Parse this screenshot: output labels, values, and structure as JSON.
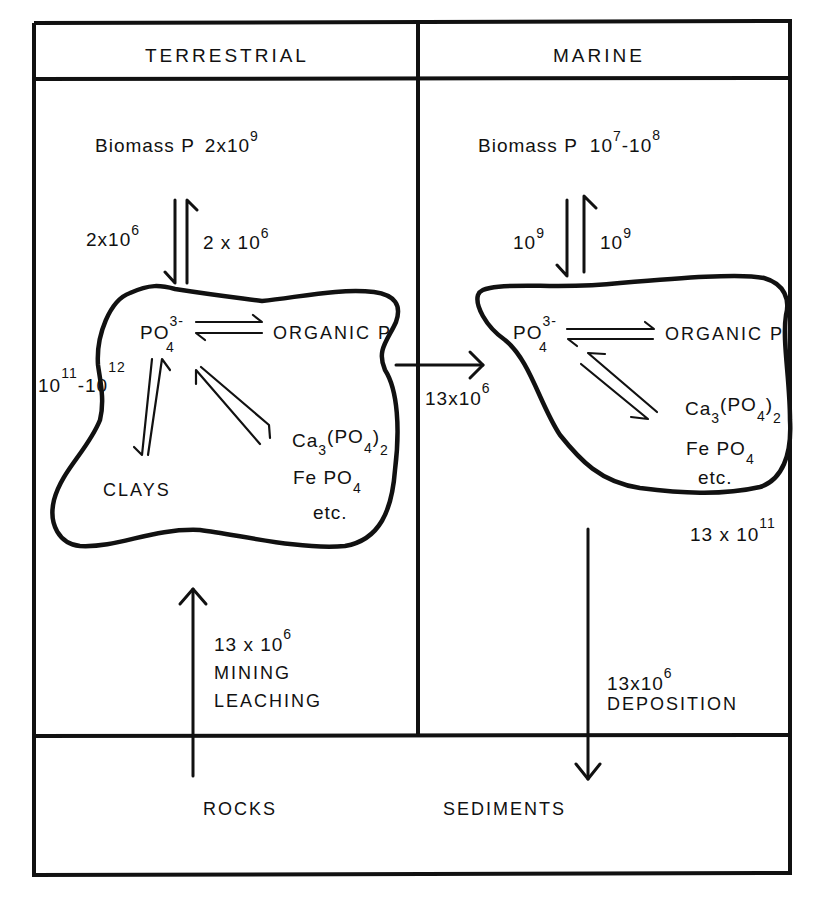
{
  "headers": {
    "terrestrial": "TERRESTRIAL",
    "marine": "MARINE"
  },
  "terrestrial": {
    "biomass": {
      "label": "Biomass  P",
      "base": "2x10",
      "exponent": "9"
    },
    "flux_down": {
      "base": "2x10",
      "exponent": "6"
    },
    "flux_up": {
      "base": "2 x 10",
      "exponent": "6"
    },
    "pool": {
      "phosphate": {
        "base": "PO",
        "subscript": "4",
        "superscript": "3-"
      },
      "organic_p": "ORGANIC P",
      "clays": "CLAYS",
      "minerals": {
        "calcium_phosphate": {
          "a": "Ca",
          "a_sub": "3",
          "b": "(PO",
          "b_sub": "4",
          "c": ")",
          "c_sub": "2"
        },
        "iron_phosphate": {
          "a": "Fe  PO",
          "a_sub": "4"
        },
        "etc": "etc."
      }
    },
    "soil_pool": {
      "base_a": "10",
      "exp_a": "11",
      "dash": "-10",
      "exp_b": "12"
    },
    "input": {
      "base": "13 x 10",
      "exponent": "6",
      "line1": "MINING",
      "line2": "LEACHING"
    }
  },
  "transfer": {
    "base": "13x10",
    "exponent": "6"
  },
  "marine": {
    "biomass": {
      "label": "Biomass   P",
      "base1": "10",
      "exp1": "7",
      "dash": "-10",
      "exp2": "8"
    },
    "flux_down": {
      "base": "10",
      "exponent": "9"
    },
    "flux_up": {
      "base": "10",
      "exponent": "9"
    },
    "pool": {
      "phosphate": {
        "base": "PO",
        "subscript": "4",
        "superscript": "3-"
      },
      "organic_p": "ORGANIC P",
      "minerals": {
        "calcium_phosphate": {
          "a": "Ca",
          "a_sub": "3",
          "b": "(PO",
          "b_sub": "4",
          "c": ")",
          "c_sub": "2"
        },
        "iron_phosphate": {
          "a": "Fe  PO",
          "a_sub": "4"
        },
        "etc": "etc."
      }
    },
    "ocean_pool": {
      "base": "13 x 10",
      "exponent": "11"
    },
    "output": {
      "base": "13x10",
      "exponent": "6",
      "line1": "DEPOSITION"
    }
  },
  "bottom": {
    "rocks": "ROCKS",
    "sediments": "SEDIMENTS"
  }
}
